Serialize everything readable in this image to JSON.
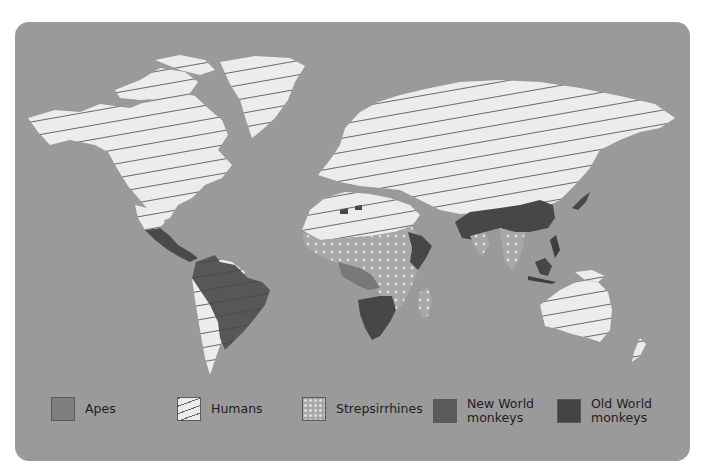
{
  "map": {
    "background_color": "#9a9a9a",
    "ocean_color": "#9a9a9a",
    "land_default_color": "#ececec"
  },
  "legend": {
    "items": [
      {
        "key": "apes",
        "label": "Apes",
        "color": "#7e7e7e",
        "pattern": "solid"
      },
      {
        "key": "humans",
        "label": "Humans",
        "color": "#ececec",
        "pattern": "diagonal-lines"
      },
      {
        "key": "strepsirrhines",
        "label": "Strepsirrhines",
        "color": "#a8a8a8",
        "pattern": "dots"
      },
      {
        "key": "new_world_monkeys",
        "label": "New World\nmonkeys",
        "color": "#5a5a5a",
        "pattern": "solid"
      },
      {
        "key": "old_world_monkeys",
        "label": "Old World\nmonkeys",
        "color": "#444444",
        "pattern": "solid"
      }
    ]
  },
  "regions": [
    {
      "name": "North America",
      "distribution": [
        "humans"
      ]
    },
    {
      "name": "Greenland",
      "distribution": [
        "humans"
      ]
    },
    {
      "name": "Central America",
      "distribution": [
        "humans",
        "new_world_monkeys"
      ]
    },
    {
      "name": "South America",
      "distribution": [
        "humans",
        "new_world_monkeys"
      ]
    },
    {
      "name": "Europe and Northern Asia",
      "distribution": [
        "humans"
      ]
    },
    {
      "name": "North Africa",
      "distribution": [
        "humans",
        "old_world_monkeys"
      ]
    },
    {
      "name": "Sub-Saharan Africa",
      "distribution": [
        "humans",
        "strepsirrhines",
        "apes",
        "old_world_monkeys"
      ]
    },
    {
      "name": "Madagascar",
      "distribution": [
        "humans",
        "strepsirrhines"
      ]
    },
    {
      "name": "South and Southeast Asia",
      "distribution": [
        "humans",
        "old_world_monkeys",
        "strepsirrhines",
        "apes"
      ]
    },
    {
      "name": "Japan",
      "distribution": [
        "humans",
        "old_world_monkeys"
      ]
    },
    {
      "name": "Indonesia and Philippines",
      "distribution": [
        "humans",
        "old_world_monkeys",
        "apes"
      ]
    },
    {
      "name": "Australia",
      "distribution": [
        "humans"
      ]
    },
    {
      "name": "New Zealand",
      "distribution": [
        "humans"
      ]
    }
  ]
}
